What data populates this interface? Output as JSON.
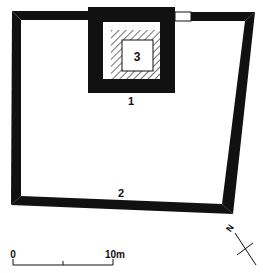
{
  "diagram": {
    "type": "architectural-plan",
    "colors": {
      "wall": "#111111",
      "background": "#ffffff",
      "hatch": "#222222"
    },
    "labels": {
      "tower": "1",
      "enclosure": "2",
      "inner_room": "3"
    },
    "scale_bar": {
      "start_label": "0",
      "end_label": "10m"
    },
    "north_arrow": {
      "label": "N"
    }
  }
}
